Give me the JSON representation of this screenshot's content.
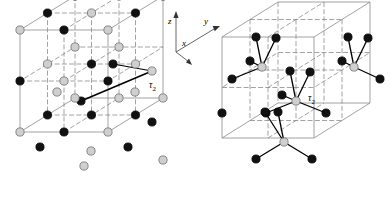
{
  "figure": {
    "type": "crystal-structure-diagram",
    "background_color": "#ffffff",
    "panel_count": 2,
    "axes": {
      "name": "coordinate-triad",
      "origin_px": [
        176,
        52
      ],
      "labels": {
        "x": "x",
        "y": "y",
        "z": "z"
      },
      "x_label_pos": [
        183,
        44
      ],
      "y_label_pos": [
        205,
        22
      ],
      "z_label_pos": [
        170,
        22
      ],
      "tips": {
        "z": [
          176,
          13
        ],
        "y": [
          218,
          28
        ],
        "x": [
          190,
          58
        ]
      },
      "color": "#555555"
    },
    "atom_styles": {
      "dark": {
        "fill": "#111111",
        "stroke": "#000000",
        "radius": 4.1
      },
      "light": {
        "fill": "#cfcfcf",
        "stroke": "#7a7a7a",
        "radius": 4.1
      }
    },
    "cell_edge_color": "#8a8a8a",
    "bond_color": "#000000",
    "panels": [
      {
        "name": "rocksalt-structure",
        "label": "τ2",
        "label_text": "τ",
        "label_sub": "2",
        "label_pos": [
          150,
          86
        ],
        "description": "rock-salt type lattice, two interpenetrating fcc sublattices, 2x2x2 grid of alternating dark and light atoms",
        "cube": {
          "origin_px": [
            20,
            132
          ],
          "ax_px": [
            88,
            0
          ],
          "ay_px": [
            55,
            -34
          ],
          "az_px": [
            0,
            -102
          ],
          "divisions": 2
        },
        "tau_vector": {
          "from_px": [
            81,
            101
          ],
          "to_px": [
            152,
            71
          ]
        }
      },
      {
        "name": "zincblende-structure",
        "label": "τ2",
        "label_text": "τ",
        "label_sub": "2",
        "label_pos": [
          309,
          99
        ],
        "description": "zincblende / diamond type lattice, tetrahedrally bonded dark and light atoms inside cubic cell",
        "cube": {
          "origin_px": [
            222,
            138
          ],
          "ax_px": [
            92,
            0
          ],
          "ay_px": [
            56,
            -35
          ],
          "az_px": [
            0,
            -101
          ],
          "divisions": 2
        }
      }
    ]
  }
}
